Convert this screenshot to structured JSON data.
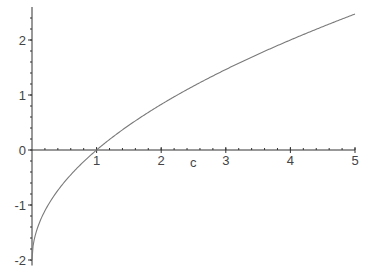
{
  "chart_data": {
    "type": "line",
    "title": "",
    "xlabel": "c",
    "ylabel": "",
    "xlim": [
      0,
      5
    ],
    "ylim": [
      -2.1,
      2.6
    ],
    "grid": false,
    "legend": null,
    "x_ticks": [
      {
        "value": 1,
        "label": "1"
      },
      {
        "value": 2,
        "label": "2"
      },
      {
        "value": 3,
        "label": "3"
      },
      {
        "value": 4,
        "label": "4"
      },
      {
        "value": 5,
        "label": "5"
      }
    ],
    "y_ticks": [
      {
        "value": 2,
        "label": "2"
      },
      {
        "value": 1,
        "label": "1"
      },
      {
        "value": 0,
        "label": "0"
      },
      {
        "value": -1,
        "label": "-1"
      },
      {
        "value": -2,
        "label": "-2"
      }
    ],
    "series": [
      {
        "name": "curve",
        "expression": "2*(sqrt(c)-1)",
        "color": "#7a7a7a",
        "x": [
          0,
          0.05,
          0.1,
          0.2,
          0.3,
          0.5,
          0.75,
          1,
          1.5,
          2,
          2.5,
          3,
          3.5,
          4,
          4.5,
          5
        ],
        "y": [
          -2.0,
          -1.55,
          -1.37,
          -1.11,
          -0.9,
          -0.59,
          -0.27,
          0.0,
          0.45,
          0.83,
          1.16,
          1.46,
          1.74,
          2.0,
          2.24,
          2.47
        ]
      }
    ],
    "axis_color": "#333333"
  }
}
